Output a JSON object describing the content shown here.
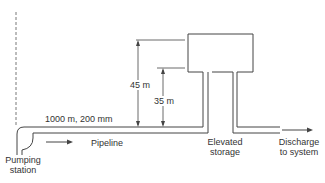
{
  "diagram": {
    "type": "water-distribution-schematic",
    "colors": {
      "line": "#444444",
      "text": "#333333",
      "background": "#ffffff"
    },
    "labels": {
      "pipe_spec": "1000 m, 200 mm",
      "pipeline": "Pipeline",
      "pumping_station_line1": "Pumping",
      "pumping_station_line2": "station",
      "tank_height_top": "45 m",
      "tank_height_bottom": "35 m",
      "elevated_storage_line1": "Elevated",
      "elevated_storage_line2": "storage",
      "discharge_line1": "Discharge",
      "discharge_line2": "to system"
    },
    "dimensions": {
      "pipe_length": "1000 m",
      "pipe_diameter": "200 mm",
      "water_level_max": "45 m",
      "water_level_min": "35 m"
    }
  }
}
